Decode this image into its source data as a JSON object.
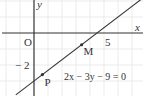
{
  "diagram": {
    "type": "coordinate-plane",
    "axes": {
      "x_label": "x",
      "y_label": "y",
      "origin_label": "O",
      "x_range": [
        -2.4,
        7.8
      ],
      "y_range": [
        -3.9,
        2.1
      ]
    },
    "ticks": {
      "x": [
        {
          "value": 5,
          "label": "5"
        }
      ],
      "y": [
        {
          "value": -2,
          "label": "− 2"
        }
      ]
    },
    "grid": {
      "on": true,
      "x_step": 1,
      "y_step": 1,
      "color": "#e6e6e6"
    },
    "line": {
      "equation": "2x − 3y − 9 = 0",
      "a": 2,
      "b": -3,
      "c": -9,
      "color": "#333333"
    },
    "points": [
      {
        "name": "M",
        "x": 3.4,
        "y": -0.73
      },
      {
        "name": "P",
        "x": 0.6,
        "y": -2.6
      }
    ],
    "colors": {
      "axis": "#333333",
      "grid": "#e6e6e6",
      "text": "#333333"
    }
  }
}
